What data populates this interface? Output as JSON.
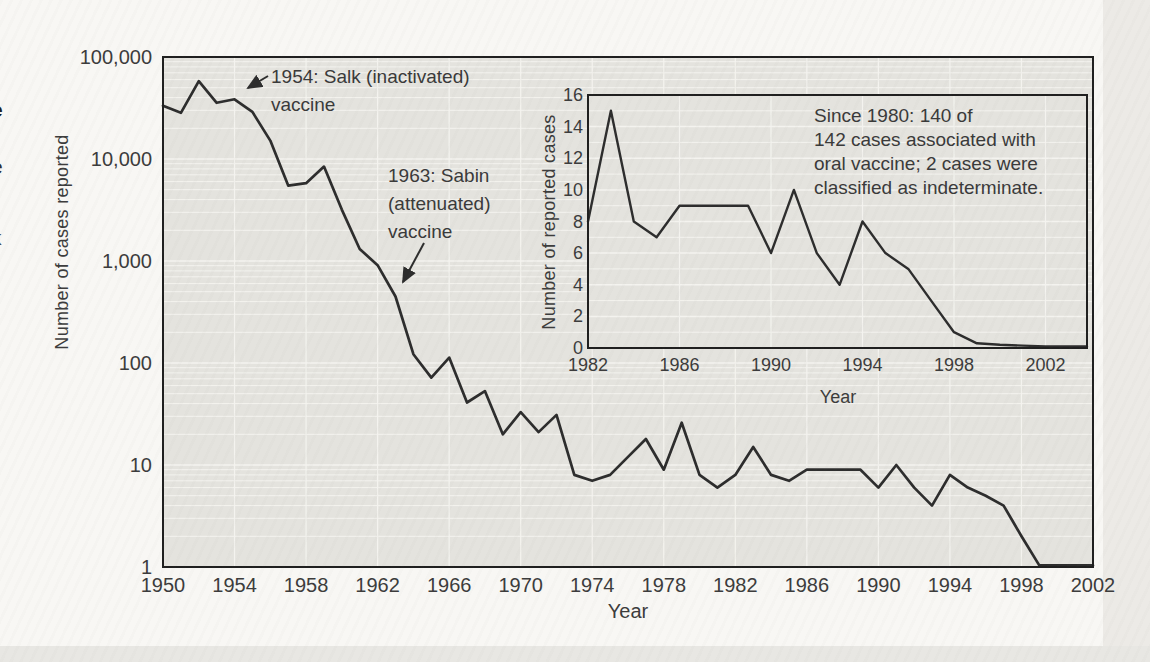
{
  "page": {
    "left_margin_fragments": [
      "e",
      "e",
      "k"
    ]
  },
  "colors": {
    "page_bg": "#f8f7f4",
    "panel_bg": "#e4e3de",
    "grid_line": "#f4f3ef",
    "data_line": "#2d2d2d",
    "border": "#1f1f1f",
    "text": "#3c3c3c"
  },
  "chart_data": [
    {
      "id": "main",
      "type": "line",
      "xlabel": "Year",
      "ylabel": "Number of cases reported",
      "y_scale": "log",
      "xlim": [
        1950,
        2002
      ],
      "ylim": [
        1,
        100000
      ],
      "grid": true,
      "x_tick_labels": [
        "1950",
        "1954",
        "1958",
        "1962",
        "1966",
        "1970",
        "1974",
        "1978",
        "1982",
        "1986",
        "1990",
        "1994",
        "1998",
        "2002"
      ],
      "y_tick_labels": [
        "100,000",
        "10,000",
        "1,000",
        "100",
        "10",
        "1"
      ],
      "x": [
        1950,
        1951,
        1952,
        1953,
        1954,
        1955,
        1956,
        1957,
        1958,
        1959,
        1960,
        1961,
        1962,
        1963,
        1964,
        1965,
        1966,
        1967,
        1968,
        1969,
        1970,
        1971,
        1972,
        1973,
        1974,
        1975,
        1976,
        1977,
        1978,
        1979,
        1980,
        1981,
        1982,
        1983,
        1984,
        1985,
        1986,
        1987,
        1988,
        1989,
        1990,
        1991,
        1992,
        1993,
        1994,
        1995,
        1996,
        1997,
        1998,
        1999,
        2000,
        2001,
        2002
      ],
      "values": [
        33300,
        28386,
        57879,
        35592,
        38476,
        28985,
        15140,
        5485,
        5787,
        8425,
        3190,
        1312,
        910,
        449,
        122,
        72,
        113,
        41,
        53,
        20,
        33,
        21,
        31,
        8,
        7,
        8,
        12,
        18,
        9,
        26,
        8,
        6,
        8,
        15,
        8,
        7,
        9,
        9,
        9,
        9,
        6,
        10,
        6,
        4,
        8,
        6,
        5,
        4,
        2,
        1,
        1,
        1,
        1
      ],
      "annotations": [
        {
          "lines": [
            "1954: Salk (inactivated)",
            "vaccine"
          ],
          "arrow_year": 1954
        },
        {
          "lines": [
            "1963: Sabin",
            "(attenuated)",
            "vaccine"
          ],
          "arrow_year": 1963
        }
      ]
    },
    {
      "id": "inset",
      "type": "line",
      "xlabel": "Year",
      "ylabel": "Number of reported cases",
      "y_scale": "linear",
      "xlim": [
        1982,
        2003.8
      ],
      "ylim": [
        0,
        16
      ],
      "grid": true,
      "x_tick_labels": [
        "1982",
        "1986",
        "1990",
        "1994",
        "1998",
        "2002"
      ],
      "y_tick_labels": [
        "16",
        "14",
        "12",
        "10",
        "8",
        "6",
        "4",
        "2",
        "0"
      ],
      "x": [
        1982,
        1983,
        1984,
        1985,
        1986,
        1987,
        1988,
        1989,
        1990,
        1991,
        1992,
        1993,
        1994,
        1995,
        1996,
        1997,
        1998,
        1999,
        2000,
        2001,
        2002
      ],
      "values": [
        8,
        15,
        8,
        7,
        9,
        9,
        9,
        9,
        6,
        10,
        6,
        4,
        8,
        6,
        5,
        3,
        1,
        0.3,
        0.2,
        0.15,
        0.1
      ],
      "note_lines": [
        "Since 1980: 140 of",
        "142 cases associated with",
        "oral vaccine; 2 cases were",
        "classified as indeterminate."
      ]
    }
  ]
}
